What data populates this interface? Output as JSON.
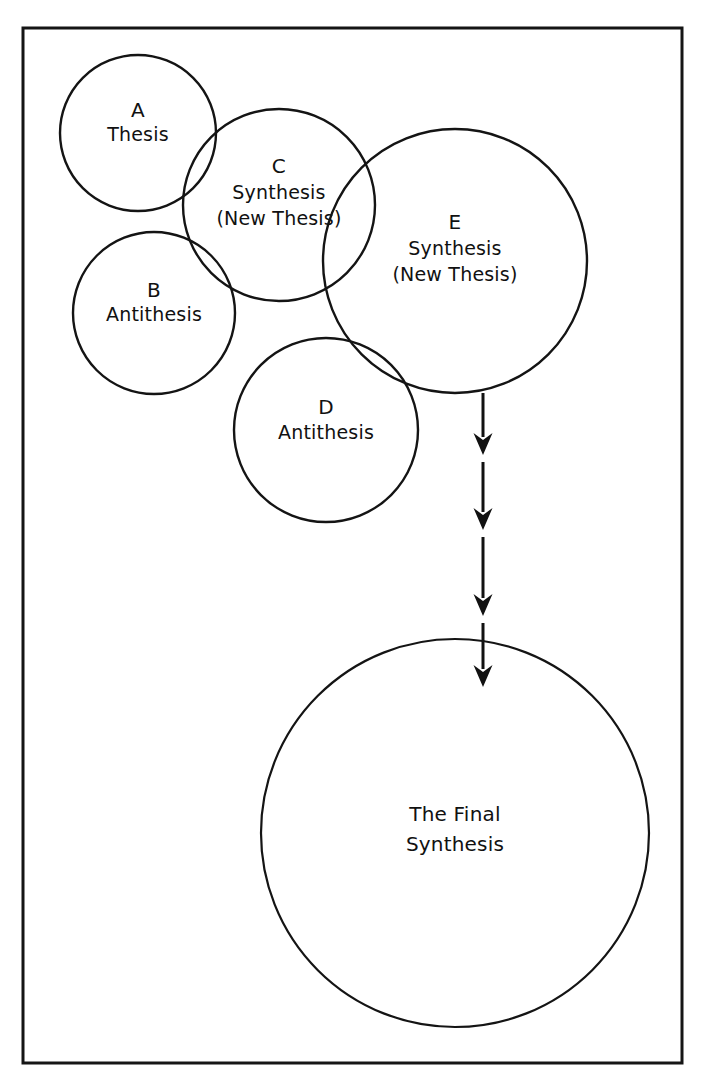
{
  "canvas": {
    "width": 704,
    "height": 1082,
    "background": "#ffffff",
    "stroke_color": "#141414",
    "text_color": "#111111"
  },
  "frame": {
    "name": "outer-border",
    "x": 23,
    "y": 28,
    "width": 659,
    "height": 1035,
    "stroke": "#151515",
    "stroke_width": 3
  },
  "diagram": {
    "type": "venn-flow",
    "circles": [
      {
        "id": "A",
        "name": "circle-a-thesis",
        "cx": 138,
        "cy": 133,
        "r": 78,
        "letter": "A",
        "lines": [
          "Thesis"
        ],
        "letter_dy": -22,
        "line_gap": 24
      },
      {
        "id": "B",
        "name": "circle-b-antithesis",
        "cx": 154,
        "cy": 313,
        "r": 81,
        "letter": "B",
        "lines": [
          "Antithesis"
        ],
        "letter_dy": -22,
        "line_gap": 24
      },
      {
        "id": "C",
        "name": "circle-c-synthesis",
        "cx": 279,
        "cy": 205,
        "r": 96,
        "letter": "C",
        "lines": [
          "Synthesis",
          "(New Thesis)"
        ],
        "letter_dy": -38,
        "line_gap": 26
      },
      {
        "id": "D",
        "name": "circle-d-antithesis",
        "cx": 326,
        "cy": 430,
        "r": 92,
        "letter": "D",
        "lines": [
          "Antithesis"
        ],
        "letter_dy": -22,
        "line_gap": 25
      },
      {
        "id": "E",
        "name": "circle-e-synthesis",
        "cx": 455,
        "cy": 261,
        "r": 132,
        "letter": "E",
        "lines": [
          "Synthesis",
          "(New Thesis)"
        ],
        "letter_dy": -38,
        "line_gap": 26
      }
    ],
    "final_circle": {
      "id": "F",
      "name": "circle-final-synthesis",
      "cx": 455,
      "cy": 833,
      "r": 194,
      "lines": [
        "The Final",
        "Synthesis"
      ],
      "first_line_dy": -18,
      "line_gap": 30
    },
    "arrow_chain": {
      "name": "arrow-chain",
      "x": 483,
      "stroke": "#111111",
      "stroke_width": 3,
      "head_width": 19,
      "head_height": 22,
      "segments": [
        {
          "name": "arrow-segment-1",
          "y_start": 393,
          "y_end": 455
        },
        {
          "name": "arrow-segment-2",
          "y_start": 462,
          "y_end": 530
        },
        {
          "name": "arrow-segment-3",
          "y_start": 537,
          "y_end": 616
        },
        {
          "name": "arrow-segment-4",
          "y_start": 623,
          "y_end": 687
        }
      ]
    }
  },
  "legend": {
    "sequence_label": "A + B → C;  C + D → E;  E → The Final Synthesis"
  }
}
